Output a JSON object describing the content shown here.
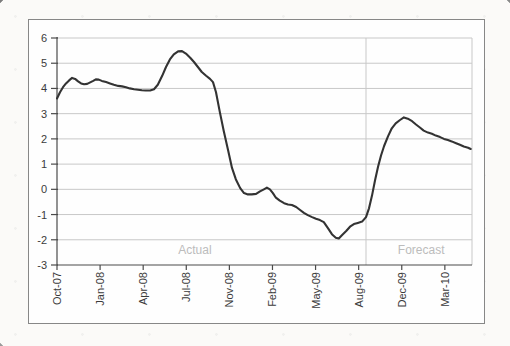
{
  "colors": {
    "outer_border": "#878787",
    "plot_background": "#fefefe",
    "grid": "#c8c8c8",
    "axis": "#4a4a4a",
    "tick": "#4a4a4a",
    "series_line": "#333333",
    "tick_label": "#3b3b3b",
    "annotation_text": "#bcbcbc",
    "divider": "#c8c8c8"
  },
  "chart_data": {
    "type": "line",
    "title": "",
    "xlabel": "",
    "ylabel": "",
    "grid": "horizontal",
    "legend": "none",
    "x_tick_labels": [
      "Oct-07",
      "Jan-08",
      "Apr-08",
      "Jul-08",
      "Nov-08",
      "Feb-09",
      "May-09",
      "Aug-09",
      "Dec-09",
      "Mar-10"
    ],
    "y_tick_labels": [
      "6",
      "5",
      "4",
      "3",
      "2",
      "1",
      "0",
      "-1",
      "-2",
      "-3"
    ],
    "ylim": [
      -3,
      6
    ],
    "xlim": [
      0,
      9.63
    ],
    "divider_x": 7.17,
    "annotations": [
      {
        "text": "Actual",
        "x": 3.2,
        "y": -2.42
      },
      {
        "text": "Forecast",
        "x": 8.45,
        "y": -2.42
      }
    ],
    "series": [
      {
        "name": "value",
        "points": [
          [
            0.0,
            3.6
          ],
          [
            0.07,
            3.85
          ],
          [
            0.14,
            4.05
          ],
          [
            0.21,
            4.2
          ],
          [
            0.28,
            4.32
          ],
          [
            0.35,
            4.42
          ],
          [
            0.42,
            4.38
          ],
          [
            0.49,
            4.28
          ],
          [
            0.56,
            4.2
          ],
          [
            0.63,
            4.17
          ],
          [
            0.7,
            4.18
          ],
          [
            0.77,
            4.24
          ],
          [
            0.84,
            4.3
          ],
          [
            0.9,
            4.36
          ],
          [
            0.97,
            4.35
          ],
          [
            1.04,
            4.3
          ],
          [
            1.14,
            4.25
          ],
          [
            1.23,
            4.2
          ],
          [
            1.32,
            4.15
          ],
          [
            1.42,
            4.1
          ],
          [
            1.51,
            4.08
          ],
          [
            1.6,
            4.05
          ],
          [
            1.69,
            4.0
          ],
          [
            1.79,
            3.97
          ],
          [
            1.88,
            3.95
          ],
          [
            1.97,
            3.93
          ],
          [
            2.06,
            3.92
          ],
          [
            2.16,
            3.92
          ],
          [
            2.25,
            3.97
          ],
          [
            2.34,
            4.15
          ],
          [
            2.44,
            4.5
          ],
          [
            2.53,
            4.85
          ],
          [
            2.62,
            5.15
          ],
          [
            2.71,
            5.35
          ],
          [
            2.81,
            5.47
          ],
          [
            2.9,
            5.48
          ],
          [
            2.99,
            5.38
          ],
          [
            3.09,
            5.22
          ],
          [
            3.18,
            5.05
          ],
          [
            3.27,
            4.85
          ],
          [
            3.36,
            4.65
          ],
          [
            3.46,
            4.5
          ],
          [
            3.55,
            4.38
          ],
          [
            3.62,
            4.25
          ],
          [
            3.69,
            3.85
          ],
          [
            3.78,
            3.05
          ],
          [
            3.87,
            2.3
          ],
          [
            3.97,
            1.55
          ],
          [
            4.06,
            0.85
          ],
          [
            4.15,
            0.4
          ],
          [
            4.25,
            0.05
          ],
          [
            4.34,
            -0.15
          ],
          [
            4.43,
            -0.2
          ],
          [
            4.52,
            -0.2
          ],
          [
            4.62,
            -0.18
          ],
          [
            4.71,
            -0.08
          ],
          [
            4.8,
            0.0
          ],
          [
            4.87,
            0.07
          ],
          [
            4.94,
            0.0
          ],
          [
            5.01,
            -0.15
          ],
          [
            5.08,
            -0.33
          ],
          [
            5.17,
            -0.45
          ],
          [
            5.27,
            -0.55
          ],
          [
            5.36,
            -0.6
          ],
          [
            5.45,
            -0.62
          ],
          [
            5.55,
            -0.7
          ],
          [
            5.64,
            -0.82
          ],
          [
            5.73,
            -0.93
          ],
          [
            5.82,
            -1.02
          ],
          [
            5.92,
            -1.1
          ],
          [
            6.01,
            -1.17
          ],
          [
            6.1,
            -1.22
          ],
          [
            6.19,
            -1.3
          ],
          [
            6.29,
            -1.55
          ],
          [
            6.38,
            -1.78
          ],
          [
            6.47,
            -1.92
          ],
          [
            6.54,
            -1.95
          ],
          [
            6.61,
            -1.82
          ],
          [
            6.71,
            -1.65
          ],
          [
            6.8,
            -1.48
          ],
          [
            6.89,
            -1.38
          ],
          [
            6.98,
            -1.33
          ],
          [
            7.08,
            -1.28
          ],
          [
            7.17,
            -1.1
          ],
          [
            7.24,
            -0.75
          ],
          [
            7.31,
            -0.25
          ],
          [
            7.38,
            0.35
          ],
          [
            7.45,
            0.9
          ],
          [
            7.52,
            1.35
          ],
          [
            7.59,
            1.72
          ],
          [
            7.68,
            2.1
          ],
          [
            7.77,
            2.42
          ],
          [
            7.86,
            2.62
          ],
          [
            7.96,
            2.75
          ],
          [
            8.05,
            2.85
          ],
          [
            8.14,
            2.8
          ],
          [
            8.24,
            2.7
          ],
          [
            8.33,
            2.57
          ],
          [
            8.42,
            2.45
          ],
          [
            8.51,
            2.33
          ],
          [
            8.61,
            2.25
          ],
          [
            8.7,
            2.2
          ],
          [
            8.79,
            2.13
          ],
          [
            8.89,
            2.07
          ],
          [
            8.98,
            2.0
          ],
          [
            9.07,
            1.95
          ],
          [
            9.16,
            1.9
          ],
          [
            9.26,
            1.83
          ],
          [
            9.35,
            1.77
          ],
          [
            9.44,
            1.7
          ],
          [
            9.54,
            1.65
          ],
          [
            9.6,
            1.6
          ]
        ]
      }
    ]
  }
}
